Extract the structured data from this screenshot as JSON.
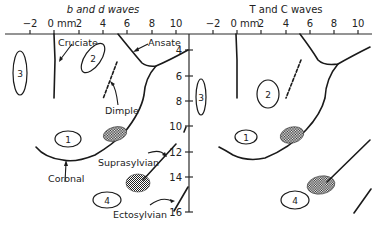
{
  "figure": {
    "left_panel": {
      "title": "b and d waves",
      "x_ticks": [
        "−2",
        "0 mm",
        "2",
        "4",
        "6",
        "8",
        "10"
      ],
      "y_ticks": [
        "4",
        "6",
        "8",
        "10",
        "12",
        "14",
        "16"
      ],
      "regions": [
        "1",
        "2",
        "3",
        "4"
      ],
      "labels": {
        "cruciate": "Cruciate",
        "ansate": "Ansate",
        "dimple": "Dimple",
        "coronal": "Coronal",
        "suprasylvian": "Suprasylvian",
        "ectosylvian": "Ectosylvian"
      }
    },
    "right_panel": {
      "title": "T and C waves",
      "x_ticks": [
        "−2",
        "0 mm",
        "2",
        "4",
        "6",
        "8",
        "10"
      ],
      "regions": [
        "1",
        "2",
        "3",
        "4"
      ]
    }
  }
}
